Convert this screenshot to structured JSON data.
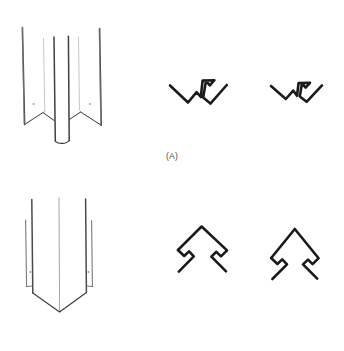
{
  "figure": {
    "background_color": "#ffffff",
    "width": 344,
    "height": 351,
    "stroke_dark": "#1a1a1a",
    "stroke_mid": "#6e6e6e",
    "stroke_light": "#b5b5b5"
  },
  "panels": [
    {
      "id": "A",
      "caption": "(A)",
      "perspective_label": "v-fold-column-perspective",
      "description": "Folded sheet column with three V lobes, corrugated profile",
      "cross_sections": [
        {
          "label": "v-profile-open",
          "description": "Open V cross-section with central hook notch"
        },
        {
          "label": "v-profile-compact",
          "description": "Compact V cross-section with central hook notch"
        }
      ]
    },
    {
      "id": "B",
      "caption": "(B)",
      "perspective_label": "chevron-column-perspective",
      "description": "Folded sheet column with single chevron apex and pointed base",
      "cross_sections": [
        {
          "label": "chevron-profile-asymmetric",
          "description": "Chevron cross-section with one hooked leg"
        },
        {
          "label": "chevron-profile-symmetric",
          "description": "Chevron cross-section with two hooked legs"
        }
      ]
    }
  ]
}
